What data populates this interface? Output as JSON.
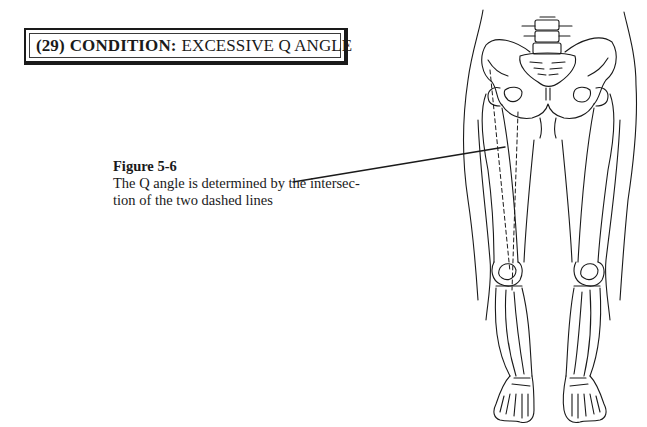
{
  "condition_header": {
    "number": "(29)",
    "label": "CONDITION:",
    "name": "EXCESSIVE Q ANGLE"
  },
  "figure": {
    "title": "Figure 5-6",
    "caption_lines": [
      "The Q angle is determined by the intersec-",
      "tion of the two dashed lines"
    ]
  },
  "illustration": {
    "subject": "anterior view of pelvis and lower limb skeleton",
    "annotation": "two dashed lines indicating the Q angle on the right leg"
  },
  "colors": {
    "ink": "#1a1a1a",
    "background": "#ffffff"
  }
}
